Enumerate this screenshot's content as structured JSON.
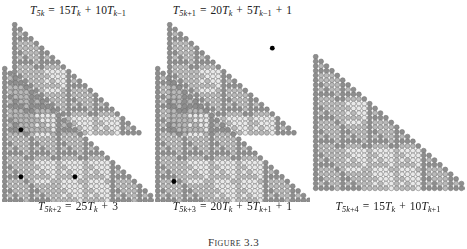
{
  "figure": {
    "caption": "Figure 3.3",
    "caption_top": 236,
    "background": "#ffffff"
  },
  "palette": {
    "dark": "#8e8e8e",
    "mid": "#b9b9b9",
    "light": "#e9e9e9",
    "outline": "#6f6f6f",
    "marker": "#000000",
    "text": "#202020"
  },
  "panels": [
    {
      "id": "panel-left",
      "label_top": "T_{5k} = 15T_k + 10T_{k-1}",
      "label_top_html": "T<sub>5<span class=\"up\">k</span></sub> <span class=\"op\">=</span> <span class=\"num\">15</span>T<sub><span class=\"up\">k</span></sub> <span class=\"op\">+</span> <span class=\"num\">10</span>T<sub><span class=\"up\">k</span><span class=\"num\">&#8722;1</span></sub>",
      "label_bottom": "T_{5k+2} = 25T_k + 3",
      "label_bottom_html": "T<sub>5<span class=\"up\">k</span><span class=\"num\">+2</span></sub> <span class=\"op\">=</span> <span class=\"num\">25</span>T<sub><span class=\"up\">k</span></sub> <span class=\"op\">+</span> <span class=\"num\">3</span>",
      "left": 2,
      "top": 4,
      "width": 152,
      "canvas_top": 22,
      "label_bottom_top": 200,
      "order": 5,
      "shape": "two-triangles",
      "markers": [
        {
          "row": 13,
          "col": 3
        },
        {
          "row": 23,
          "col": 3
        },
        {
          "row": 23,
          "col": 13
        }
      ]
    },
    {
      "id": "panel-middle",
      "label_top": "T_{5k+1} = 20T_k + 5T_{k-1} + 1",
      "label_top_html": "T<sub>5<span class=\"up\">k</span><span class=\"num\">+1</span></sub> <span class=\"op\">=</span> <span class=\"num\">20</span>T<sub><span class=\"up\">k</span></sub> <span class=\"op\">+</span> <span class=\"num\">5</span>T<sub><span class=\"up\">k</span><span class=\"num\">&#8722;1</span></sub> <span class=\"op\">+</span> <span class=\"num\">1</span>",
      "label_bottom": "T_{5k+3} = 20T_k + 5T_{k+1} + 1",
      "label_bottom_html": "T<sub>5<span class=\"up\">k</span><span class=\"num\">+3</span></sub> <span class=\"op\">=</span> <span class=\"num\">20</span>T<sub><span class=\"up\">k</span></sub> <span class=\"op\">+</span> <span class=\"num\">5</span>T<sub><span class=\"up\">k</span><span class=\"num\">+1</span></sub> <span class=\"op\">+</span> <span class=\"num\">1</span>",
      "left": 155,
      "top": 4,
      "width": 155,
      "canvas_top": 22,
      "label_bottom_top": 200,
      "order": 5,
      "shape": "two-triangles",
      "markers": [
        {
          "row": 5,
          "col": 19
        },
        {
          "row": 24,
          "col": 3
        }
      ]
    },
    {
      "id": "panel-right",
      "label_top": "",
      "label_top_html": "",
      "label_bottom": "T_{5k+4} = 15T_k + 10T_{k+1}",
      "label_bottom_html": "T<sub>5<span class=\"up\">k</span><span class=\"num\">+4</span></sub> <span class=\"op\">=</span> <span class=\"num\">15</span>T<sub><span class=\"up\">k</span></sub> <span class=\"op\">+</span> <span class=\"num\">10</span>T<sub><span class=\"up\">k</span><span class=\"num\">+1</span></sub>",
      "left": 311,
      "top": 4,
      "width": 154,
      "canvas_top": 56,
      "label_bottom_top": 200,
      "order": 5,
      "shape": "one-triangle",
      "markers": []
    }
  ],
  "geometry": {
    "circle_diameter": 5.4,
    "row_step": 4.7,
    "col_step": 5.4,
    "rows_big": 29,
    "rows_small": 24,
    "marker_radius": 2.4
  }
}
